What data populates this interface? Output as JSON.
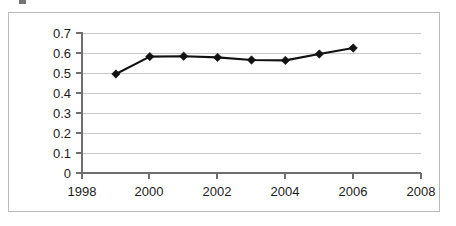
{
  "chart_data": {
    "type": "line",
    "title": "",
    "subtitle": "",
    "xlabel": "",
    "ylabel": "",
    "x": [
      1999,
      2000,
      2001,
      2002,
      2003,
      2004,
      2005,
      2006
    ],
    "values": [
      0.495,
      0.582,
      0.584,
      0.578,
      0.565,
      0.563,
      0.595,
      0.625
    ],
    "series": [
      {
        "name": "",
        "values": [
          0.495,
          0.582,
          0.584,
          0.578,
          0.565,
          0.563,
          0.595,
          0.625
        ]
      }
    ],
    "xlim": [
      1998,
      2008
    ],
    "ylim": [
      0,
      0.7
    ],
    "x_tick_labels": [
      "1998",
      "2000",
      "2002",
      "2004",
      "2006",
      "2008"
    ],
    "x_tick_values": [
      1998,
      2000,
      2002,
      2004,
      2006,
      2008
    ],
    "y_tick_labels": [
      "0.7",
      "0.6",
      "0.5",
      "0.4",
      "0.3",
      "0.2",
      "0.1",
      "0"
    ],
    "y_tick_values": [
      0.7,
      0.6,
      0.5,
      0.4,
      0.3,
      0.2,
      0.1,
      0
    ],
    "grid": "horizontal",
    "legend": "none",
    "marker": "diamond",
    "line_color": "#111111",
    "marker_color": "#111111",
    "gridline_color": "#c8c8c8",
    "axis_color": "#6e6e6e",
    "plot_background": "#ffffff",
    "border_color": "#b9b9b9"
  }
}
